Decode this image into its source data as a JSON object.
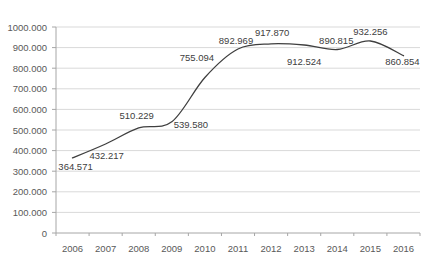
{
  "chart_data": {
    "type": "line",
    "title": "",
    "xlabel": "",
    "ylabel": "",
    "categories": [
      "2006",
      "2007",
      "2008",
      "2009",
      "2010",
      "2011",
      "2012",
      "2013",
      "2014",
      "2015",
      "2016"
    ],
    "series": [
      {
        "name": "",
        "values": [
          364571,
          432217,
          510229,
          539580,
          755094,
          892969,
          917870,
          912524,
          890815,
          932256,
          860854
        ],
        "point_labels": [
          "364.571",
          "432.217",
          "510.229",
          "539.580",
          "755.094",
          "892.969",
          "917.870",
          "912.524",
          "890.815",
          "932.256",
          "860.854"
        ],
        "color": "#3f3f3f"
      }
    ],
    "ylim": [
      0,
      1000000
    ],
    "yticks": [
      {
        "value": 0,
        "label": "0"
      },
      {
        "value": 100000,
        "label": "100.000"
      },
      {
        "value": 200000,
        "label": "200.000"
      },
      {
        "value": 300000,
        "label": "300.000"
      },
      {
        "value": 400000,
        "label": "400.000"
      },
      {
        "value": 500000,
        "label": "500.000"
      },
      {
        "value": 600000,
        "label": "600.000"
      },
      {
        "value": 700000,
        "label": "700.000"
      },
      {
        "value": 800000,
        "label": "800.000"
      },
      {
        "value": 900000,
        "label": "900.000"
      },
      {
        "value": 1000000,
        "label": "1000.000"
      }
    ],
    "grid": true,
    "legend": false,
    "smooth": true,
    "label_offsets": [
      [
        3,
        12
      ],
      [
        1,
        15
      ],
      [
        -2,
        -9
      ],
      [
        19,
        6
      ],
      [
        -8,
        -16
      ],
      [
        -2,
        -5
      ],
      [
        1,
        -8
      ],
      [
        0,
        20
      ],
      [
        -1,
        -5
      ],
      [
        0,
        -6
      ],
      [
        -1,
        9
      ]
    ],
    "colors": {
      "background": "#ffffff",
      "grid": "#d9d9d9",
      "axis": "#a6a6a6",
      "tick_text": "#595959",
      "label_text": "#404040"
    }
  }
}
